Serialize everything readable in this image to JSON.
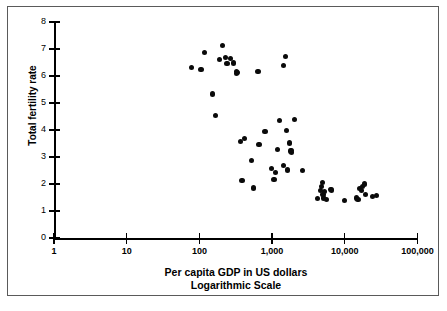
{
  "chart_data": {
    "type": "scatter",
    "title": "",
    "xlabel": "Per capita GDP in US dollars",
    "xlabel_line2": "Logarithmic Scale",
    "ylabel": "Total fertility rate",
    "xscale": "log",
    "xlim": [
      1,
      100000
    ],
    "ylim": [
      0,
      8
    ],
    "xticks": [
      1,
      10,
      100,
      1000,
      10000,
      100000
    ],
    "xtick_labels": [
      "1",
      "10",
      "100",
      "1,000",
      "10,000",
      "100,000"
    ],
    "yticks": [
      0,
      1,
      2,
      3,
      4,
      5,
      6,
      7,
      8
    ],
    "ytick_labels": [
      "0",
      "1",
      "2",
      "3",
      "4",
      "5",
      "6",
      "7",
      "8"
    ],
    "grid": false,
    "legend": null,
    "marker_color": "#0a0a0a",
    "axis_color": "#000000",
    "background_color": "#ffffff",
    "points": [
      {
        "x": 78,
        "y": 6.3
      },
      {
        "x": 105,
        "y": 6.25
      },
      {
        "x": 118,
        "y": 6.87
      },
      {
        "x": 152,
        "y": 5.33
      },
      {
        "x": 168,
        "y": 4.55
      },
      {
        "x": 190,
        "y": 6.62
      },
      {
        "x": 210,
        "y": 7.13
      },
      {
        "x": 228,
        "y": 6.7
      },
      {
        "x": 240,
        "y": 6.45
      },
      {
        "x": 265,
        "y": 6.65
      },
      {
        "x": 292,
        "y": 6.48
      },
      {
        "x": 320,
        "y": 6.18
      },
      {
        "x": 325,
        "y": 6.08
      },
      {
        "x": 330,
        "y": 6.12
      },
      {
        "x": 370,
        "y": 3.58
      },
      {
        "x": 385,
        "y": 2.12
      },
      {
        "x": 415,
        "y": 3.7
      },
      {
        "x": 520,
        "y": 2.86
      },
      {
        "x": 560,
        "y": 1.85
      },
      {
        "x": 640,
        "y": 6.18
      },
      {
        "x": 660,
        "y": 3.45
      },
      {
        "x": 800,
        "y": 3.95
      },
      {
        "x": 980,
        "y": 2.58
      },
      {
        "x": 1060,
        "y": 2.18
      },
      {
        "x": 1120,
        "y": 2.42
      },
      {
        "x": 1180,
        "y": 3.28
      },
      {
        "x": 1280,
        "y": 4.35
      },
      {
        "x": 1420,
        "y": 6.4
      },
      {
        "x": 1450,
        "y": 2.68
      },
      {
        "x": 1520,
        "y": 6.72
      },
      {
        "x": 1560,
        "y": 3.98
      },
      {
        "x": 1620,
        "y": 2.52
      },
      {
        "x": 1720,
        "y": 3.52
      },
      {
        "x": 1800,
        "y": 3.22
      },
      {
        "x": 1830,
        "y": 3.18
      },
      {
        "x": 1860,
        "y": 3.25
      },
      {
        "x": 2050,
        "y": 4.4
      },
      {
        "x": 2600,
        "y": 2.5
      },
      {
        "x": 4200,
        "y": 1.45
      },
      {
        "x": 4600,
        "y": 1.75
      },
      {
        "x": 4750,
        "y": 1.9
      },
      {
        "x": 4900,
        "y": 2.05
      },
      {
        "x": 5000,
        "y": 1.62
      },
      {
        "x": 5100,
        "y": 1.48
      },
      {
        "x": 5300,
        "y": 1.72
      },
      {
        "x": 5600,
        "y": 1.42
      },
      {
        "x": 6300,
        "y": 1.8
      },
      {
        "x": 6600,
        "y": 1.78
      },
      {
        "x": 9800,
        "y": 1.38
      },
      {
        "x": 14500,
        "y": 1.48
      },
      {
        "x": 15200,
        "y": 1.42
      },
      {
        "x": 16000,
        "y": 1.82
      },
      {
        "x": 16800,
        "y": 1.75
      },
      {
        "x": 17500,
        "y": 1.9
      },
      {
        "x": 18500,
        "y": 2.0
      },
      {
        "x": 19500,
        "y": 1.6
      },
      {
        "x": 24000,
        "y": 1.55
      },
      {
        "x": 27000,
        "y": 1.58
      }
    ]
  }
}
